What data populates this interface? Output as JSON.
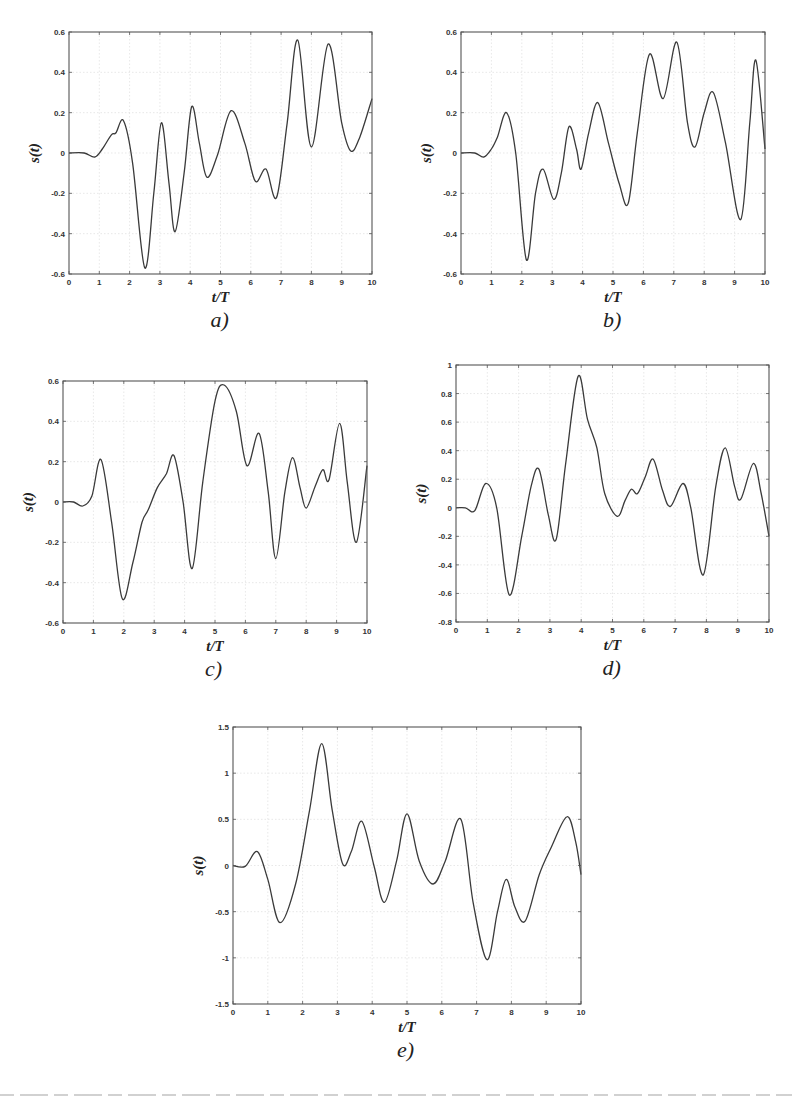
{
  "figure": {
    "panels": [
      "a)",
      "b)",
      "c)",
      "d)",
      "e)"
    ]
  },
  "chart_data": [
    {
      "id": "a",
      "type": "line",
      "label": "a)",
      "xlabel": "t/T",
      "ylabel": "s(t)",
      "xlim": [
        0,
        10
      ],
      "ylim": [
        -0.6,
        0.6
      ],
      "xticks": [
        0,
        1,
        2,
        3,
        4,
        5,
        6,
        7,
        8,
        9,
        10
      ],
      "yticks": [
        -0.6,
        -0.4,
        -0.2,
        0,
        0.2,
        0.4,
        0.6
      ],
      "ytick_labels": [
        "-0.6",
        "-0.4",
        "-0.2",
        "0",
        "0.2",
        "0.4",
        "0.6"
      ],
      "grid": true,
      "frame_px": {
        "left": 69,
        "top": 32,
        "right": 372,
        "bottom": 274
      },
      "series": [
        {
          "name": "s(t)",
          "x": [
            0,
            0.5,
            0.85,
            1.1,
            1.4,
            1.55,
            1.8,
            2.1,
            2.5,
            2.8,
            3.05,
            3.3,
            3.5,
            3.8,
            4.05,
            4.3,
            4.55,
            4.9,
            5.35,
            5.8,
            6.15,
            6.5,
            6.85,
            7.2,
            7.55,
            8.0,
            8.55,
            9.0,
            9.3,
            9.6,
            10.0
          ],
          "y": [
            0,
            0,
            -0.02,
            0.02,
            0.09,
            0.1,
            0.16,
            -0.05,
            -0.57,
            -0.2,
            0.15,
            -0.15,
            -0.39,
            -0.1,
            0.23,
            0.05,
            -0.12,
            -0.01,
            0.21,
            0.05,
            -0.14,
            -0.08,
            -0.22,
            0.15,
            0.56,
            0.03,
            0.54,
            0.15,
            0.01,
            0.08,
            0.27
          ]
        }
      ]
    },
    {
      "id": "b",
      "type": "line",
      "label": "b)",
      "xlabel": "t/T",
      "ylabel": "s(t)",
      "xlim": [
        0,
        10
      ],
      "ylim": [
        -0.6,
        0.6
      ],
      "xticks": [
        0,
        1,
        2,
        3,
        4,
        5,
        6,
        7,
        8,
        9,
        10
      ],
      "yticks": [
        -0.6,
        -0.4,
        -0.2,
        0,
        0.2,
        0.4,
        0.6
      ],
      "ytick_labels": [
        "-0.6",
        "-0.4",
        "-0.2",
        "0",
        "0.2",
        "0.4",
        "0.6"
      ],
      "grid": true,
      "frame_px": {
        "left": 461,
        "top": 32,
        "right": 765,
        "bottom": 274
      },
      "series": [
        {
          "name": "s(t)",
          "x": [
            0,
            0.45,
            0.75,
            1.0,
            1.2,
            1.5,
            1.8,
            2.15,
            2.45,
            2.7,
            3.05,
            3.3,
            3.55,
            3.8,
            3.95,
            4.2,
            4.5,
            4.85,
            5.2,
            5.5,
            5.8,
            6.2,
            6.65,
            7.1,
            7.45,
            7.7,
            8.0,
            8.3,
            8.7,
            9.2,
            9.5,
            9.7,
            10.0
          ],
          "y": [
            0,
            0,
            -0.02,
            0.02,
            0.08,
            0.2,
            0.0,
            -0.53,
            -0.2,
            -0.08,
            -0.23,
            -0.1,
            0.13,
            0.02,
            -0.08,
            0.1,
            0.25,
            0.05,
            -0.15,
            -0.25,
            0.1,
            0.49,
            0.27,
            0.55,
            0.15,
            0.03,
            0.2,
            0.3,
            0.05,
            -0.33,
            0.15,
            0.46,
            0.02
          ]
        }
      ]
    },
    {
      "id": "c",
      "type": "line",
      "label": "c)",
      "xlabel": "t/T",
      "ylabel": "s(t)",
      "xlim": [
        0,
        10
      ],
      "ylim": [
        -0.6,
        0.6
      ],
      "xticks": [
        0,
        1,
        2,
        3,
        4,
        5,
        6,
        7,
        8,
        9,
        10
      ],
      "yticks": [
        -0.6,
        -0.4,
        -0.2,
        0,
        0.2,
        0.4,
        0.6
      ],
      "ytick_labels": [
        "-0.6",
        "-0.4",
        "-0.2",
        "0",
        "0.2",
        "0.4",
        "0.6"
      ],
      "grid": true,
      "frame_px": {
        "left": 63,
        "top": 381,
        "right": 367,
        "bottom": 623
      },
      "series": [
        {
          "name": "s(t)",
          "x": [
            0,
            0.35,
            0.65,
            0.95,
            1.25,
            1.6,
            1.95,
            2.3,
            2.6,
            2.8,
            3.1,
            3.4,
            3.65,
            3.95,
            4.25,
            4.6,
            5.0,
            5.3,
            5.7,
            6.05,
            6.45,
            6.75,
            7.0,
            7.3,
            7.55,
            7.8,
            8.0,
            8.3,
            8.55,
            8.75,
            9.1,
            9.35,
            9.65,
            10.0
          ],
          "y": [
            0,
            0,
            -0.02,
            0.03,
            0.21,
            -0.1,
            -0.48,
            -0.3,
            -0.1,
            -0.04,
            0.07,
            0.14,
            0.23,
            0.0,
            -0.33,
            0.1,
            0.5,
            0.58,
            0.45,
            0.18,
            0.34,
            0.05,
            -0.28,
            0.05,
            0.22,
            0.07,
            -0.03,
            0.08,
            0.16,
            0.11,
            0.39,
            0.1,
            -0.2,
            0.18
          ]
        }
      ]
    },
    {
      "id": "d",
      "type": "line",
      "label": "d)",
      "xlabel": "t/T",
      "ylabel": "s(t)",
      "xlim": [
        0,
        10
      ],
      "ylim": [
        -0.8,
        1
      ],
      "xticks": [
        0,
        1,
        2,
        3,
        4,
        5,
        6,
        7,
        8,
        9,
        10
      ],
      "yticks": [
        -0.8,
        -0.6,
        -0.4,
        -0.2,
        0,
        0.2,
        0.4,
        0.6,
        0.8,
        1
      ],
      "ytick_labels": [
        "-0.8",
        "-0.6",
        "-0.4",
        "-0.2",
        "0",
        "0.2",
        "0.4",
        "0.6",
        "0.8",
        "1"
      ],
      "grid": true,
      "frame_px": {
        "left": 456,
        "top": 365,
        "right": 769,
        "bottom": 622
      },
      "series": [
        {
          "name": "s(t)",
          "x": [
            0,
            0.3,
            0.6,
            0.95,
            1.3,
            1.7,
            2.1,
            2.4,
            2.65,
            2.95,
            3.2,
            3.5,
            3.9,
            4.2,
            4.5,
            4.75,
            5.15,
            5.4,
            5.6,
            5.8,
            6.05,
            6.3,
            6.6,
            6.85,
            7.25,
            7.5,
            7.9,
            8.3,
            8.6,
            8.9,
            9.1,
            9.5,
            9.75,
            10.0
          ],
          "y": [
            0,
            0,
            -0.02,
            0.17,
            0.0,
            -0.61,
            -0.2,
            0.15,
            0.27,
            -0.05,
            -0.22,
            0.3,
            0.92,
            0.62,
            0.42,
            0.1,
            -0.06,
            0.05,
            0.13,
            0.1,
            0.22,
            0.34,
            0.12,
            0.01,
            0.17,
            0.0,
            -0.47,
            0.15,
            0.42,
            0.15,
            0.06,
            0.31,
            0.1,
            -0.2
          ]
        }
      ]
    },
    {
      "id": "e",
      "type": "line",
      "label": "e)",
      "xlabel": "t/T",
      "ylabel": "s(t)",
      "xlim": [
        0,
        10
      ],
      "ylim": [
        -1.5,
        1.5
      ],
      "xticks": [
        0,
        1,
        2,
        3,
        4,
        5,
        6,
        7,
        8,
        9,
        10
      ],
      "yticks": [
        -1.5,
        -1,
        -0.5,
        0,
        0.5,
        1,
        1.5
      ],
      "ytick_labels": [
        "-1.5",
        "-1",
        "-0.5",
        "0",
        "0.5",
        "1",
        "1.5"
      ],
      "grid": true,
      "frame_px": {
        "left": 233,
        "top": 727,
        "right": 581,
        "bottom": 1004
      },
      "series": [
        {
          "name": "s(t)",
          "x": [
            0,
            0.35,
            0.7,
            1.0,
            1.35,
            1.8,
            2.2,
            2.55,
            2.85,
            3.15,
            3.4,
            3.7,
            4.05,
            4.35,
            4.7,
            5.0,
            5.35,
            5.75,
            6.1,
            6.55,
            6.9,
            7.3,
            7.6,
            7.85,
            8.1,
            8.4,
            8.8,
            9.15,
            9.6,
            9.85,
            10.0
          ],
          "y": [
            0,
            -0.01,
            0.15,
            -0.15,
            -0.62,
            -0.2,
            0.6,
            1.32,
            0.6,
            0.02,
            0.15,
            0.48,
            0.0,
            -0.4,
            0.05,
            0.56,
            0.05,
            -0.2,
            0.05,
            0.5,
            -0.4,
            -1.02,
            -0.5,
            -0.15,
            -0.45,
            -0.6,
            -0.1,
            0.2,
            0.53,
            0.25,
            -0.1
          ]
        }
      ]
    }
  ]
}
